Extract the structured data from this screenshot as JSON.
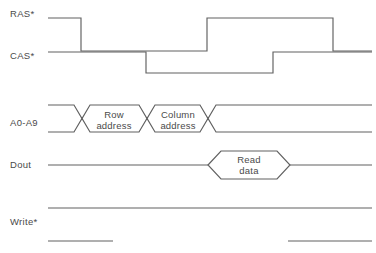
{
  "diagram": {
    "type": "timing-diagram",
    "width": 376,
    "height": 253,
    "background_color": "#ffffff",
    "line_color": "#606060",
    "text_color": "#4a4a4a",
    "signals": [
      {
        "id": "ras",
        "label": "RAS*",
        "label_x": 10,
        "label_y": 17,
        "kind": "logic",
        "high_y": 18,
        "low_y": 51,
        "start_x": 48,
        "end_x": 372,
        "transitions": [
          {
            "x": 81,
            "to": "low"
          },
          {
            "x": 207,
            "to": "high"
          },
          {
            "x": 333,
            "to": "low"
          }
        ],
        "initial": "high"
      },
      {
        "id": "cas",
        "label": "CAS*",
        "label_x": 10,
        "label_y": 59,
        "kind": "logic",
        "high_y": 52,
        "low_y": 73,
        "start_x": 48,
        "end_x": 372,
        "transitions": [
          {
            "x": 146,
            "to": "low"
          },
          {
            "x": 273,
            "to": "high"
          }
        ],
        "initial": "high"
      },
      {
        "id": "addr",
        "label": "A0-A9",
        "label_x": 10,
        "label_y": 126,
        "kind": "bus",
        "top_y": 105,
        "bottom_y": 132,
        "start_x": 48,
        "end_x": 372,
        "crossings": [
          82,
          147,
          208
        ],
        "cells": [
          {
            "text_line1": "Row",
            "text_line2": "address",
            "center_x": 114,
            "from_x": 82,
            "to_x": 147
          },
          {
            "text_line1": "Column",
            "text_line2": "address",
            "center_x": 178,
            "from_x": 147,
            "to_x": 208
          }
        ]
      },
      {
        "id": "dout",
        "label": "Dout",
        "label_x": 10,
        "label_y": 168,
        "kind": "data",
        "level_y": 165,
        "top_y": 151,
        "bottom_y": 179,
        "start_x": 48,
        "end_x": 372,
        "packet": {
          "text_line1": "Read",
          "text_line2": "data",
          "center_x": 249,
          "from_x": 208,
          "to_x": 290,
          "bevel": 13
        }
      },
      {
        "id": "write",
        "label": "Write*",
        "label_x": 10,
        "label_y": 225,
        "kind": "split",
        "high_y": 208,
        "low_y": 241,
        "high_segments": [
          {
            "from_x": 48,
            "to_x": 372
          }
        ],
        "low_segments": [
          {
            "from_x": 48,
            "to_x": 113
          },
          {
            "from_x": 288,
            "to_x": 372
          }
        ]
      }
    ]
  }
}
